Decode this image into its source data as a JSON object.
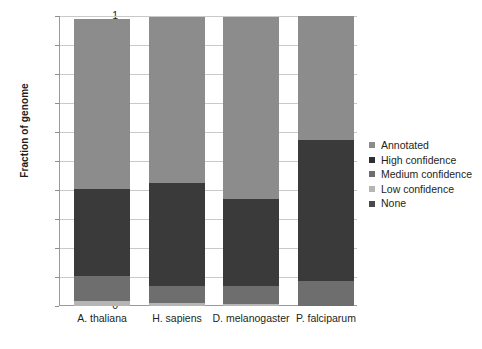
{
  "chart_data": {
    "type": "bar",
    "subtype": "stacked-bar-100",
    "title": "",
    "xlabel": "",
    "ylabel": "Fraction of genome",
    "ylim": [
      0,
      1
    ],
    "yticks": [
      "0",
      "0.1",
      "0.2",
      "0.3",
      "0.4",
      "0.5",
      "0.6",
      "0.7",
      "0.8",
      "0.9",
      "1"
    ],
    "ytick_values": [
      0,
      0.1,
      0.2,
      0.3,
      0.4,
      0.5,
      0.6,
      0.7,
      0.8,
      0.9,
      1
    ],
    "grid": true,
    "legend_position": "right",
    "categories": [
      "A. thaliana",
      "H. sapiens",
      "D. melanogaster",
      "P. falciparum"
    ],
    "series": [
      {
        "name": "Annotated",
        "color": "#8c8c8c",
        "values": [
          0.586,
          0.572,
          0.627,
          0.428
        ]
      },
      {
        "name": "High confidence",
        "color": "#3a3a3a",
        "values": [
          0.299,
          0.357,
          0.3,
          0.486
        ]
      },
      {
        "name": "Medium confidence",
        "color": "#6e6e6e",
        "values": [
          0.087,
          0.058,
          0.062,
          0.086
        ]
      },
      {
        "name": "Low confidence",
        "color": "#b5b5b5",
        "values": [
          0.018,
          0.01,
          0.007,
          0.0
        ]
      },
      {
        "name": "None",
        "color": "#4a4a4a",
        "values": [
          0.01,
          0.003,
          0.004,
          0.0
        ]
      }
    ],
    "stack_order_bottom_to_top": [
      "Low confidence",
      "Medium confidence",
      "High confidence",
      "Annotated"
    ]
  },
  "legend": {
    "items": [
      {
        "label": "Annotated",
        "color": "#8c8c8c"
      },
      {
        "label": "High confidence",
        "color": "#2f2f2f"
      },
      {
        "label": "Medium confidence",
        "color": "#6e6e6e"
      },
      {
        "label": "Low confidence",
        "color": "#b5b5b5"
      },
      {
        "label": "None",
        "color": "#4a4a4a"
      }
    ]
  },
  "axes": {
    "y_title": "Fraction of genome"
  },
  "colors": {
    "gridline": "#c9c9c9",
    "axis": "#9a9a9a",
    "text": "#231f20",
    "background": "#ffffff"
  }
}
